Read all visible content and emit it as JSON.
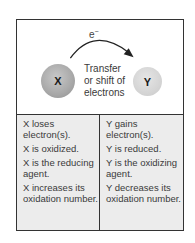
{
  "diagram": {
    "electron_label": "e",
    "electron_charge": "−",
    "donor": {
      "label": "X",
      "color": "#a8a8a8"
    },
    "acceptor": {
      "label": "Y",
      "color": "#d2d2d2"
    },
    "transfer_text": [
      "Transfer",
      "or shift of",
      "electrons"
    ]
  },
  "table": {
    "left": [
      "X loses electron(s).",
      "X is oxidized.",
      "X is the reducing agent.",
      "X increases its oxidation number."
    ],
    "right": [
      "Y gains electron(s).",
      "Y is reduced.",
      "Y is the oxidizing agent.",
      "Y decreases its oxidation number."
    ]
  }
}
